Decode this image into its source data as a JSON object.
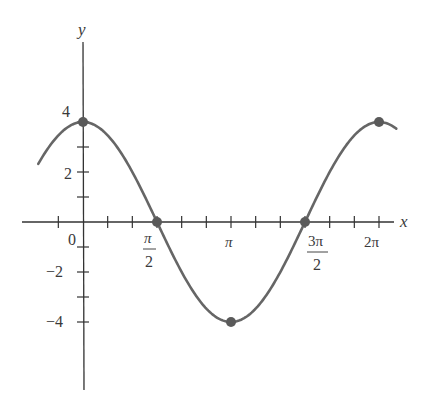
{
  "chart_data": {
    "type": "line",
    "title": "",
    "function": "y = 4 cos x",
    "xlabel": "x",
    "ylabel": "y",
    "x_ticks": [
      {
        "value": 0,
        "label": "0"
      },
      {
        "value": 1.5708,
        "label_num": "π",
        "label_den": "2"
      },
      {
        "value": 3.1416,
        "label": "π"
      },
      {
        "value": 4.7124,
        "label_num": "3π",
        "label_den": "2"
      },
      {
        "value": 6.2832,
        "label": "2π"
      }
    ],
    "y_ticks": [
      {
        "value": 4,
        "label": "4"
      },
      {
        "value": 2,
        "label": "2"
      },
      {
        "value": -2,
        "label": "−2"
      },
      {
        "value": -4,
        "label": "−4"
      }
    ],
    "minor_tick_step_x": "π/6",
    "minor_tick_step_y": 1,
    "xlim": [
      -1.0,
      6.6
    ],
    "ylim": [
      -6.8,
      7.2
    ],
    "grid": false,
    "legend": null,
    "series": [
      {
        "name": "4cos(x)",
        "x_range": [
          -0.95,
          6.65
        ],
        "color": "#666666"
      }
    ],
    "highlighted_points": [
      {
        "x": 0,
        "y": 4
      },
      {
        "x": 1.5708,
        "y": 0
      },
      {
        "x": 3.1416,
        "y": -4
      },
      {
        "x": 4.7124,
        "y": 0
      },
      {
        "x": 6.2832,
        "y": 4
      }
    ]
  },
  "labels": {
    "x_axis": "x",
    "y_axis": "y",
    "origin": "0",
    "pi_half_num": "π",
    "pi_half_den": "2",
    "pi": "π",
    "three_pi_half_num": "3π",
    "three_pi_half_den": "2",
    "two_pi": "2π",
    "y4": "4",
    "y2": "2",
    "yneg2": "−2",
    "yneg4": "−4"
  },
  "colors": {
    "curve": "#666666",
    "axis": "#333333",
    "dot": "#5a5a5a"
  }
}
